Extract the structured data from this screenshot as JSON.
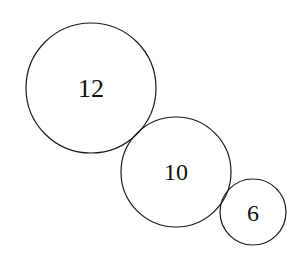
{
  "diagram": {
    "type": "tangent-circles",
    "stroke_color": "#1a1a1a",
    "circles": [
      {
        "label": "12",
        "cx": 91,
        "cy": 88,
        "r": 65,
        "font_size": 26
      },
      {
        "label": "10",
        "cx": 176,
        "cy": 172,
        "r": 55,
        "font_size": 24
      },
      {
        "label": "6",
        "cx": 253,
        "cy": 212,
        "r": 33,
        "font_size": 24
      }
    ]
  }
}
